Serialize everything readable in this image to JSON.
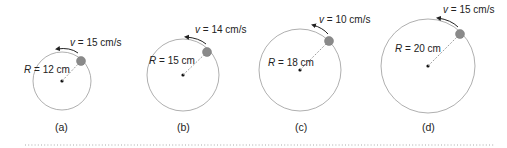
{
  "figure": {
    "panels": [
      {
        "id": "a",
        "caption": "(a)",
        "radius_label": "R",
        "radius_value": "= 12 cm",
        "speed_label": "v",
        "speed_value": "= 15 cm/s",
        "cx": 62,
        "cy": 81,
        "r": 29,
        "angle": 48
      },
      {
        "id": "b",
        "caption": "(b)",
        "radius_label": "R",
        "radius_value": "= 15 cm",
        "speed_label": "v",
        "speed_value": "= 14 cm/s",
        "cx": 183,
        "cy": 75,
        "r": 36,
        "angle": 48
      },
      {
        "id": "c",
        "caption": "(c)",
        "radius_label": "R",
        "radius_value": "= 18 cm",
        "speed_label": "v",
        "speed_value": "= 10 cm/s",
        "cx": 300,
        "cy": 70,
        "r": 41,
        "angle": 48
      },
      {
        "id": "d",
        "caption": "(d)",
        "radius_label": "R",
        "radius_value": "= 20 cm",
        "speed_label": "v",
        "speed_value": "= 15 cm/s",
        "cx": 428,
        "cy": 66,
        "r": 47,
        "angle": 48
      }
    ],
    "colors": {
      "circle": "#9a9a9a",
      "ball": "#8a8a8a",
      "ball_edge": "#777777",
      "text": "#222222",
      "divider": "#aaaaaa"
    }
  }
}
